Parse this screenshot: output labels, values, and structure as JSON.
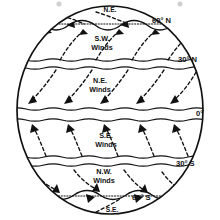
{
  "diagram": {
    "type": "earth-wind-circulation",
    "colors": {
      "ink": "#111111",
      "paper": "#ffffff",
      "speck": "#cfcfcf"
    },
    "latitude_labels": [
      {
        "id": "lat-60n",
        "text": "60° N",
        "x": 152,
        "y": 23
      },
      {
        "id": "lat-30n",
        "text": "30° N",
        "x": 178,
        "y": 62
      },
      {
        "id": "lat-0",
        "text": "0°",
        "x": 196,
        "y": 113
      },
      {
        "id": "lat-30s",
        "text": "30° S",
        "x": 176,
        "y": 166
      },
      {
        "id": "lat-60s",
        "text": "60° S",
        "x": 132,
        "y": 200
      }
    ],
    "wind_labels": [
      {
        "id": "wind-polar-ne-north",
        "line1": "N.E.",
        "line2": "",
        "x": 110,
        "y": 11
      },
      {
        "id": "wind-sw-north",
        "line1": "S.W.",
        "line2": "Winds",
        "x": 102,
        "y": 41
      },
      {
        "id": "wind-ne-trades",
        "line1": "N.E.",
        "line2": "Winds",
        "x": 100,
        "y": 82
      },
      {
        "id": "wind-se-trades",
        "line1": "S.E.",
        "line2": "Winds",
        "x": 106,
        "y": 137
      },
      {
        "id": "wind-nw-south",
        "line1": "N.W.",
        "line2": "Winds",
        "x": 104,
        "y": 173
      },
      {
        "id": "wind-polar-se-south",
        "line1": "S.E.",
        "line2": "",
        "x": 110,
        "y": 211
      }
    ],
    "band_boundaries": [
      {
        "id": "band-60n-upper",
        "latitude": "60° N"
      },
      {
        "id": "band-30n-upper",
        "latitude": "30° N"
      },
      {
        "id": "band-30n-lower",
        "latitude": "30° N"
      },
      {
        "id": "band-0-upper",
        "latitude": "0°"
      },
      {
        "id": "band-0-lower",
        "latitude": "0°"
      },
      {
        "id": "band-30s-upper",
        "latitude": "30° S"
      },
      {
        "id": "band-30s-lower",
        "latitude": "30° S"
      },
      {
        "id": "band-60s-lower",
        "latitude": "60° S"
      }
    ]
  }
}
